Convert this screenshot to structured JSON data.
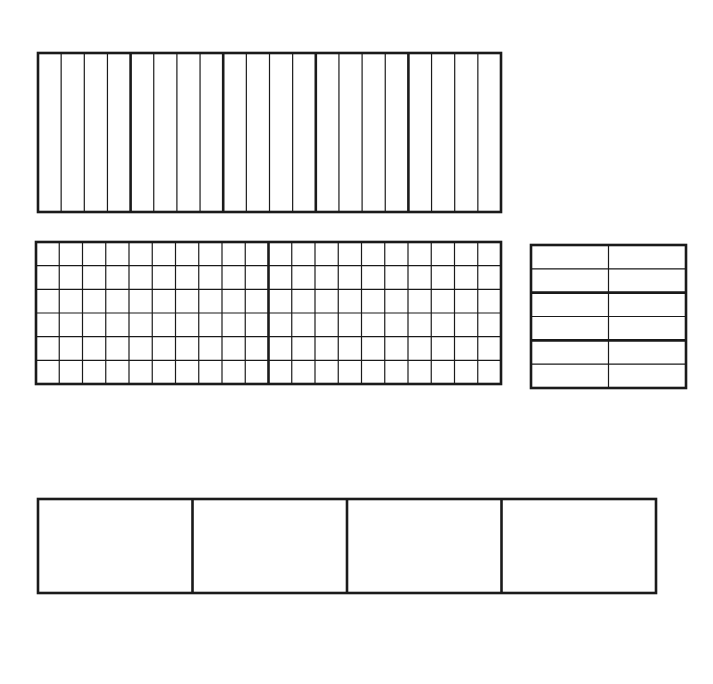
{
  "canvas": {
    "width": 713,
    "height": 684,
    "background": "#ffffff",
    "stroke": "#1a1a1a"
  },
  "figures": [
    {
      "id": "strip-model",
      "description": "Rectangle divided into 5 equal parts, each part split into 4 strips (20 vertical strips)",
      "x": 38,
      "y": 53,
      "width": 463,
      "height": 159,
      "major_cols": 5,
      "minor_cols_per_major": 4,
      "major_rows": 1,
      "minor_rows_per_major": 1
    },
    {
      "id": "square-grid-model",
      "description": "Rectangle divided into 2 equal halves, each half a 10 x 6 grid",
      "x": 36,
      "y": 242,
      "width": 465,
      "height": 142,
      "major_cols": 2,
      "minor_cols_per_major": 10,
      "major_rows": 1,
      "minor_rows_per_major": 6
    },
    {
      "id": "small-grid-model",
      "description": "Rectangle divided into 3 horizontal bands, each band split into 2 rows, with 2 columns",
      "x": 531,
      "y": 245,
      "width": 155,
      "height": 143,
      "major_cols": 1,
      "minor_cols_per_major": 2,
      "major_rows": 3,
      "minor_rows_per_major": 2
    },
    {
      "id": "fourths-model",
      "description": "Rectangle divided into 4 equal parts",
      "x": 38,
      "y": 499,
      "width": 618,
      "height": 94,
      "major_cols": 4,
      "minor_cols_per_major": 1,
      "major_rows": 1,
      "minor_rows_per_major": 1
    }
  ]
}
